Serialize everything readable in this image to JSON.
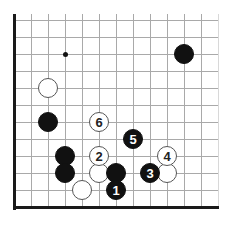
{
  "diagram": {
    "type": "go-board-position",
    "title": "",
    "board": {
      "origin_x": 14,
      "origin_y": 20,
      "spacing": 17,
      "cols": 13,
      "rows": 12,
      "left_edge": true,
      "bottom_edge": true,
      "line_color": "#a9a9a9",
      "edge_color": "#1a1a1a",
      "background": "#ffffff"
    },
    "star_points": [
      {
        "name": "star-point-upper-left",
        "col": 3,
        "row": 2
      }
    ],
    "stones": [
      {
        "name": "white-stone-a",
        "color": "white",
        "col": 2,
        "row": 4,
        "label": ""
      },
      {
        "name": "black-stone-a",
        "color": "black",
        "col": 2,
        "row": 6,
        "label": ""
      },
      {
        "name": "black-stone-b",
        "color": "black",
        "col": 10,
        "row": 2,
        "label": ""
      },
      {
        "name": "white-stone-move-6",
        "color": "white",
        "col": 5,
        "row": 6,
        "label": "6"
      },
      {
        "name": "black-stone-move-5",
        "color": "black",
        "col": 7,
        "row": 7,
        "label": "5"
      },
      {
        "name": "black-stone-c",
        "color": "black",
        "col": 3,
        "row": 8,
        "label": ""
      },
      {
        "name": "white-stone-move-2",
        "color": "white",
        "col": 5,
        "row": 8,
        "label": "2"
      },
      {
        "name": "white-stone-move-4",
        "color": "white",
        "col": 9,
        "row": 8,
        "label": "4"
      },
      {
        "name": "black-stone-d",
        "color": "black",
        "col": 3,
        "row": 9,
        "label": ""
      },
      {
        "name": "white-stone-b",
        "color": "white",
        "col": 5,
        "row": 9,
        "label": ""
      },
      {
        "name": "black-stone-e",
        "color": "black",
        "col": 6,
        "row": 9,
        "label": ""
      },
      {
        "name": "black-stone-move-3",
        "color": "black",
        "col": 8,
        "row": 9,
        "label": "3"
      },
      {
        "name": "white-stone-c",
        "color": "white",
        "col": 9,
        "row": 9,
        "label": ""
      },
      {
        "name": "white-stone-d",
        "color": "white",
        "col": 4,
        "row": 10,
        "label": ""
      },
      {
        "name": "black-stone-move-1",
        "color": "black",
        "col": 6,
        "row": 10,
        "label": "1"
      }
    ],
    "move_labels": [
      "1",
      "2",
      "3",
      "4",
      "5",
      "6"
    ],
    "colors": {
      "black_stone": "#111111",
      "white_stone": "#ffffff",
      "white_stone_border": "#555555",
      "grid": "#a9a9a9",
      "edge": "#1a1a1a",
      "black_label_text": "#ffffff",
      "white_label_text": "#222222"
    }
  }
}
